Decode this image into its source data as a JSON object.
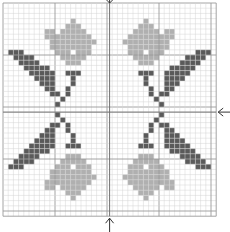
{
  "pattern": {
    "title": "Cross-stitch flower motif chart",
    "grid": {
      "cols": 41,
      "rows": 41,
      "cell": 5.2,
      "origin_x": 3,
      "origin_y": 3,
      "major_every": 10
    },
    "colors": {
      "background": "#ffffff",
      "grid_minor": "#d4d4d4",
      "grid_major": "#9a9a9a",
      "center_line": "#707070",
      "light": "#b0b0b0",
      "dark": "#5a5a5a",
      "arrow": "#333333"
    },
    "center_markers": [
      "top-arrow",
      "bottom-arrow",
      "right-arrow"
    ],
    "quadrant_top_left": {
      "light": [
        [
          13,
          3
        ],
        [
          12,
          4
        ],
        [
          13,
          4
        ],
        [
          14,
          4
        ],
        [
          8,
          5
        ],
        [
          9,
          5
        ],
        [
          11,
          5
        ],
        [
          12,
          5
        ],
        [
          13,
          5
        ],
        [
          14,
          5
        ],
        [
          15,
          5
        ],
        [
          8,
          6
        ],
        [
          9,
          6
        ],
        [
          10,
          6
        ],
        [
          11,
          6
        ],
        [
          12,
          6
        ],
        [
          13,
          6
        ],
        [
          14,
          6
        ],
        [
          15,
          6
        ],
        [
          16,
          6
        ],
        [
          9,
          7
        ],
        [
          10,
          7
        ],
        [
          11,
          7
        ],
        [
          12,
          7
        ],
        [
          13,
          7
        ],
        [
          14,
          7
        ],
        [
          15,
          7
        ],
        [
          16,
          7
        ],
        [
          17,
          7
        ],
        [
          9,
          8
        ],
        [
          10,
          8
        ],
        [
          11,
          8
        ],
        [
          12,
          8
        ],
        [
          13,
          8
        ],
        [
          14,
          8
        ],
        [
          15,
          8
        ],
        [
          16,
          8
        ],
        [
          10,
          9
        ],
        [
          11,
          9
        ],
        [
          12,
          9
        ],
        [
          14,
          9
        ],
        [
          15,
          9
        ],
        [
          16,
          9
        ],
        [
          11,
          10
        ],
        [
          12,
          10
        ],
        [
          13,
          10
        ],
        [
          14,
          10
        ],
        [
          15,
          10
        ],
        [
          12,
          11
        ],
        [
          13,
          11
        ],
        [
          14,
          11
        ]
      ],
      "dark": [
        [
          1,
          9
        ],
        [
          2,
          9
        ],
        [
          3,
          9
        ],
        [
          2,
          10
        ],
        [
          3,
          10
        ],
        [
          4,
          10
        ],
        [
          5,
          10
        ],
        [
          3,
          11
        ],
        [
          4,
          11
        ],
        [
          5,
          11
        ],
        [
          6,
          11
        ],
        [
          4,
          12
        ],
        [
          5,
          12
        ],
        [
          6,
          12
        ],
        [
          7,
          12
        ],
        [
          8,
          12
        ],
        [
          5,
          13
        ],
        [
          6,
          13
        ],
        [
          7,
          13
        ],
        [
          8,
          13
        ],
        [
          9,
          13
        ],
        [
          6,
          14
        ],
        [
          7,
          14
        ],
        [
          8,
          14
        ],
        [
          9,
          14
        ],
        [
          7,
          15
        ],
        [
          8,
          15
        ],
        [
          9,
          15
        ],
        [
          8,
          16
        ],
        [
          9,
          16
        ],
        [
          9,
          17
        ],
        [
          10,
          17
        ],
        [
          13,
          13
        ],
        [
          12,
          13
        ],
        [
          14,
          13
        ],
        [
          13,
          14
        ],
        [
          13,
          15
        ],
        [
          12,
          16
        ],
        [
          12,
          17
        ],
        [
          11,
          18
        ],
        [
          10,
          19
        ]
      ]
    }
  }
}
